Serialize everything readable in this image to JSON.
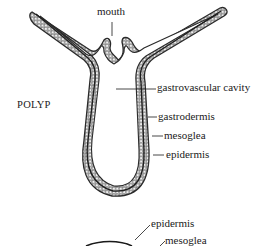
{
  "figure": {
    "title": "POLYP",
    "labels": {
      "mouth": "mouth",
      "gastrovascular_cavity": "gastrovascular cavity",
      "gastrodermis": "gastrodermis",
      "mesoglea": "mesoglea",
      "epidermis": "epidermis",
      "epidermis_lower": "epidermis",
      "mesoglea_lower": "mesoglea"
    },
    "colors": {
      "outline": "#2a2a2a",
      "cell_fill": "#d9d9d9",
      "text": "#1a1a1a"
    }
  }
}
